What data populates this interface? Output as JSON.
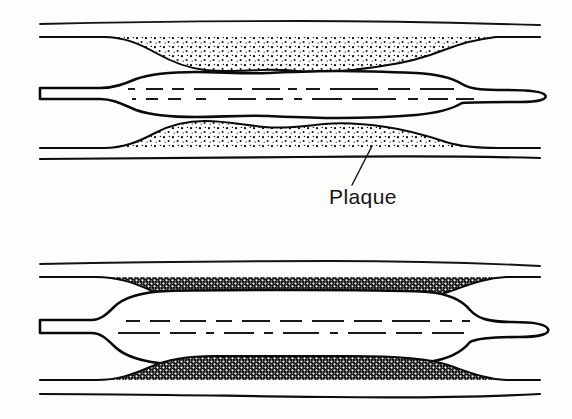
{
  "figure": {
    "background_color": "#fdfdfd",
    "ink_color": "#0d0d0d",
    "width": 572,
    "height": 419
  },
  "labels": [
    {
      "id": "plaque",
      "text": "Plaque",
      "x": 329,
      "y": 204,
      "font_size": 21,
      "leader": {
        "x1": 352,
        "y1": 185,
        "x2": 372,
        "y2": 146
      }
    }
  ],
  "panels": [
    {
      "id": "upper-panel",
      "name": "partially-inflated-balloon",
      "caption_visible": false,
      "description": "Partially inflated balloon catheter within a stenotic artery; plaque rendered as light stipple",
      "plaque_fill": "light-stipple",
      "plaque_color": "#ffffff",
      "plaque_dot_color": "#0d0d0d",
      "balloon_state": "partially-inflated",
      "geometry": {
        "wall_outer_top_y": 25,
        "wall_inner_top_y": 37,
        "shaft_top_y": 88,
        "shaft_bottom_y": 99,
        "wall_inner_bottom_y": 148,
        "wall_outer_bottom_y": 159,
        "lumen_left_x": 40,
        "lumen_right_x": 540,
        "balloon_left_x": 112,
        "balloon_right_x": 468,
        "tip_right_x": 546
      }
    },
    {
      "id": "lower-panel",
      "name": "fully-inflated-balloon",
      "caption_visible": false,
      "description": "Fully inflated balloon compressing plaque against the arterial wall; plaque rendered as dense dark stipple",
      "plaque_fill": "dark-stipple",
      "plaque_color": "#151515",
      "plaque_dot_color": "#ffffff",
      "balloon_state": "fully-inflated",
      "geometry": {
        "wall_outer_top_y": 265,
        "wall_inner_top_y": 277,
        "shaft_top_y": 320,
        "shaft_bottom_y": 333,
        "wall_inner_bottom_y": 380,
        "wall_outer_bottom_y": 395,
        "lumen_left_x": 40,
        "lumen_right_x": 540,
        "balloon_left_x": 105,
        "balloon_right_x": 470,
        "tip_right_x": 548
      }
    }
  ]
}
